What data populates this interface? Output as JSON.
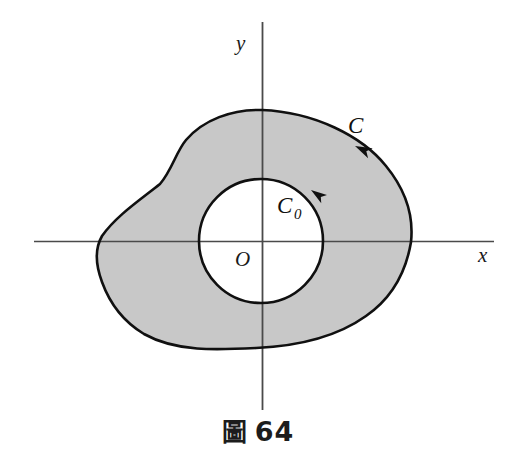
{
  "figure": {
    "caption_prefix": "圖",
    "caption_number": "64",
    "caption_full": "圖 64",
    "background_color": "#ffffff",
    "region_fill_color": "#c8c8c8",
    "curve_stroke_color": "#101010",
    "axis_stroke_color": "#4a4a4a"
  },
  "axes": {
    "x_label": "x",
    "y_label": "y",
    "origin_label": "O",
    "x_axis": {
      "x1": 34,
      "y1": 241,
      "x2": 494,
      "y2": 241
    },
    "y_axis": {
      "x1": 262,
      "y1": 22,
      "x2": 262,
      "y2": 410
    },
    "x_label_pos": {
      "x": 478,
      "y": 262
    },
    "y_label_pos": {
      "x": 236,
      "y": 50
    },
    "origin_label_pos": {
      "x": 235,
      "y": 266
    }
  },
  "curves": [
    {
      "name": "outer-boundary",
      "label": "C",
      "label_pos": {
        "x": 348,
        "y": 133
      },
      "orientation": "counterclockwise",
      "arrow_pos": {
        "x": 355,
        "y": 146
      },
      "arrow_angle_deg": 205,
      "extents": {
        "left": 98,
        "right": 411,
        "top": 110,
        "bottom": 348
      },
      "path": "M 262 110 C 232 109 203 120 186 140 C 176 152 172 170 160 184 C 140 200 116 216 102 236 C 94 250 96 266 102 282 C 110 304 124 322 144 334 C 176 352 216 350 256 348 C 300 346 338 336 366 316 C 392 298 406 272 411 242 C 414 214 404 188 386 166 C 362 136 314 112 262 110 Z"
    },
    {
      "name": "inner-boundary",
      "label": "C",
      "label_subscript": "0",
      "label_pos": {
        "x": 277,
        "y": 213
      },
      "label_sub_pos": {
        "x": 295,
        "y": 219
      },
      "orientation": "clockwise",
      "arrow_pos": {
        "x": 311,
        "y": 190
      },
      "arrow_angle_deg": 215,
      "center": {
        "x": 261,
        "y": 241
      },
      "radius": 62
    }
  ]
}
